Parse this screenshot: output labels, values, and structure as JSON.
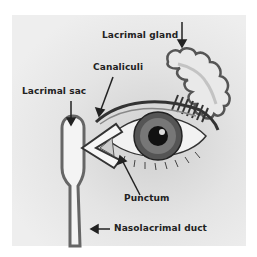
{
  "diagram": {
    "type": "anatomical-illustration",
    "labels": {
      "lacrimal_gland": "Lacrimal gland",
      "canaliculi": "Canaliculi",
      "lacrimal_sac": "Lacrimal sac",
      "punctum": "Punctum",
      "nasolacrimal_duct": "Nasolacrimal duct"
    },
    "colors": {
      "background": "#ffffff",
      "panel": "#e8e8e8",
      "outline": "#444444",
      "text": "#222222"
    }
  }
}
